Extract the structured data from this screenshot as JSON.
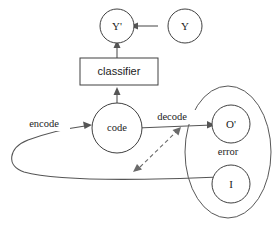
{
  "diagram": {
    "background_color": "#ffffff",
    "stroke_color": "#555555",
    "text_color": "#1c1c1c",
    "nodes": {
      "y_pred": {
        "label": "Y'",
        "shape": "circle"
      },
      "y_true": {
        "label": "Y",
        "shape": "circle"
      },
      "classifier": {
        "label": "classifier",
        "shape": "rectangle"
      },
      "code": {
        "label": "code",
        "shape": "circle"
      },
      "output": {
        "label": "O'",
        "shape": "circle"
      },
      "input": {
        "label": "I",
        "shape": "circle"
      },
      "error_group": {
        "label": "error",
        "shape": "ellipse"
      }
    },
    "edges": {
      "encode": {
        "label": "encode",
        "style": "solid"
      },
      "decode": {
        "label": "decode",
        "style": "solid"
      },
      "error_compare": {
        "label": "",
        "style": "dashed"
      },
      "y_to_ypred": {
        "label": "",
        "style": "solid"
      },
      "code_to_classifier": {
        "label": "",
        "style": "solid"
      },
      "classifier_to_ypred": {
        "label": "",
        "style": "solid"
      },
      "input_feedback": {
        "label": "",
        "style": "solid"
      }
    }
  }
}
